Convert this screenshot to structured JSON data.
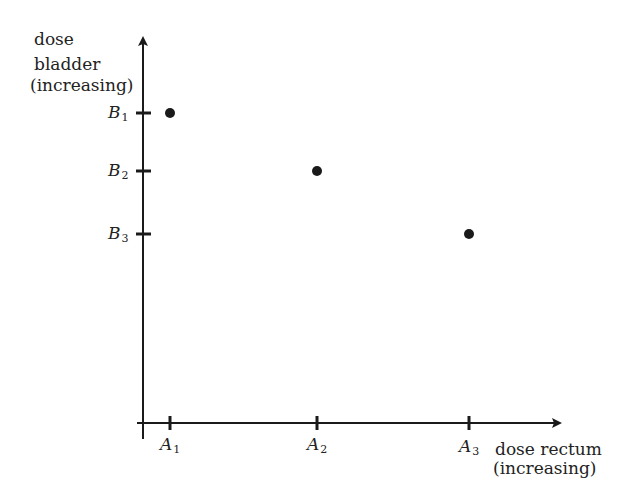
{
  "diagram": {
    "y_axis": {
      "label_lines": [
        "dose",
        "bladder",
        "(increasing)"
      ],
      "ticks": [
        {
          "base": "B",
          "sub": "1",
          "y": 113
        },
        {
          "base": "B",
          "sub": "2",
          "y": 171
        },
        {
          "base": "B",
          "sub": "3",
          "y": 234
        }
      ]
    },
    "x_axis": {
      "label_lines": [
        "dose rectum",
        "(increasing)"
      ],
      "ticks": [
        {
          "base": "A",
          "sub": "1",
          "x": 170
        },
        {
          "base": "A",
          "sub": "2",
          "x": 317
        },
        {
          "base": "A",
          "sub": "3",
          "x": 469
        }
      ]
    },
    "points": [
      {
        "label": "(A1, B1)",
        "x": 170,
        "y": 113
      },
      {
        "label": "(A2, B2)",
        "x": 317,
        "y": 171
      },
      {
        "label": "(A3, B3)",
        "x": 469,
        "y": 234
      }
    ],
    "colors": {
      "ink": "#1a1a1a",
      "background": "#ffffff"
    }
  }
}
